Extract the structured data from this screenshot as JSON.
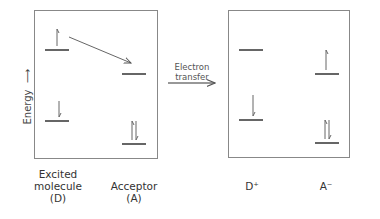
{
  "axis": {
    "label": "Energy",
    "arrow": "→"
  },
  "process": {
    "label_line1": "Electron",
    "label_line2": "transfer"
  },
  "before": {
    "donor": {
      "line1": "Excited",
      "line2": "molecule",
      "line3": "(D)"
    },
    "acceptor": {
      "line1": "Acceptor",
      "line2": "(A)"
    }
  },
  "after": {
    "donor": {
      "label": "D⁺"
    },
    "acceptor": {
      "label": "A⁻"
    }
  },
  "colors": {
    "line": "#333333",
    "box": "#777777",
    "arrow": "#555555"
  }
}
